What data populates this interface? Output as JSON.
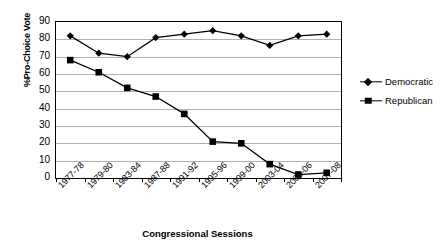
{
  "chart_data": {
    "type": "line",
    "title": "",
    "xlabel": "Congressional Sessions",
    "ylabel": "%Pro-Choice Vote",
    "ylim": [
      0,
      90
    ],
    "ytick_step": 10,
    "yticks": [
      90,
      80,
      70,
      60,
      50,
      40,
      30,
      20,
      10,
      0
    ],
    "grid": true,
    "legend_position": "right",
    "categories": [
      "1977-78",
      "1979-80",
      "1983-84",
      "1987-88",
      "1991-92",
      "1995-96",
      "1999-00",
      "2003-04",
      "2005-06",
      "2007-08"
    ],
    "series": [
      {
        "name": "Democratic",
        "marker": "diamond",
        "color": "#000000",
        "values": [
          82,
          72,
          70,
          81,
          83,
          85,
          82,
          76.5,
          82,
          83
        ]
      },
      {
        "name": "Republican",
        "marker": "square",
        "color": "#000000",
        "values": [
          68,
          61,
          52,
          47,
          37,
          21,
          20,
          8,
          2,
          3
        ]
      }
    ]
  },
  "legend": {
    "items": [
      {
        "label": "Democratic",
        "marker": "diamond"
      },
      {
        "label": "Republican",
        "marker": "square"
      }
    ]
  },
  "colors": {
    "series": "#000000",
    "gridline": "#b0b0b0",
    "axis": "#000000",
    "background": "#ffffff"
  }
}
